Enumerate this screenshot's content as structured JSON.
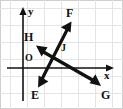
{
  "figure": {
    "kind": "coordinate-plane-vector-diagram",
    "width": 123,
    "height": 109,
    "background_color": "#ffffff",
    "frame_color": "#cfcfcf",
    "grid_color": "#e2e2e2",
    "ink_color": "#111111"
  },
  "grid": {
    "visible": true,
    "vertical_lines_x": [
      10,
      27,
      44,
      61,
      78,
      95,
      112
    ],
    "horizontal_lines_y": [
      8,
      25,
      42,
      59,
      76,
      93
    ],
    "cell_size": 17
  },
  "axes": {
    "origin": {
      "x": 23,
      "y": 68,
      "label": "O",
      "label_x": 26,
      "label_y": 55
    },
    "y_axis": {
      "label": "y",
      "label_x": 29,
      "label_y": 9,
      "from_x": 23,
      "from_y": 101,
      "to_x": 23,
      "to_y": 9,
      "arrow": "up"
    },
    "x_axis": {
      "label": "x",
      "label_x": 105,
      "label_y": 72,
      "from_x": 7,
      "from_y": 68,
      "to_x": 114,
      "to_y": 68,
      "arrow": "right"
    }
  },
  "vectors": [
    {
      "name": "segment-EF",
      "style": "double-headed-arrow",
      "endpoints": [
        {
          "label": "E",
          "tip_x": 38,
          "tip_y": 86,
          "label_x": 33,
          "label_y": 92
        },
        {
          "label": "F",
          "tip_x": 71,
          "tip_y": 23,
          "label_x": 68,
          "label_y": 10
        }
      ]
    },
    {
      "name": "segment-HG",
      "style": "double-headed-arrow",
      "endpoints": [
        {
          "label": "H",
          "tip_x": 37,
          "tip_y": 47,
          "label_x": 25,
          "label_y": 33
        },
        {
          "label": "G",
          "tip_x": 100,
          "tip_y": 85,
          "label_x": 103,
          "label_y": 92
        }
      ]
    }
  ],
  "points": [
    {
      "label": "J",
      "description": "intersection point of the two segments",
      "x": 55,
      "y": 53,
      "label_x": 62,
      "label_y": 45
    }
  ],
  "labels": {
    "E": "E",
    "F": "F",
    "G": "G",
    "H": "H",
    "J": "J",
    "O": "O",
    "x": "x",
    "y": "y"
  }
}
